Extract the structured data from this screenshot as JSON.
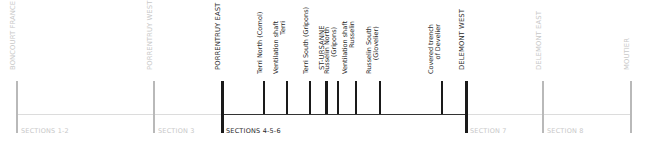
{
  "colors": {
    "active": "#1a1a1a",
    "inactive_tick": "#b9b9b9",
    "inactive_line": "#dcdcdc",
    "inactive_text": "#c8c8c8",
    "active_text": "#2a2a2a"
  },
  "stations": [
    {
      "name": "BONCOURT FRANCE",
      "lines": [
        "BONCOURT FRANCE"
      ],
      "kind": "major",
      "active": false
    },
    {
      "name": "PORRENTRUY WEST",
      "lines": [
        "PORRENTRUY WEST"
      ],
      "kind": "major",
      "active": false
    },
    {
      "name": "PORRENTRUY EAST",
      "lines": [
        "PORRENTRUY EAST"
      ],
      "kind": "major",
      "active": true
    },
    {
      "name": "Terri North (Cornol)",
      "lines": [
        "Terri North (Cornol)"
      ],
      "kind": "minor",
      "active": true
    },
    {
      "name": "Ventilation shaft Terri",
      "lines": [
        "Ventilation shaft",
        "Terri"
      ],
      "kind": "minor",
      "active": true
    },
    {
      "name": "Terri South (Gripons)",
      "lines": [
        "Terri South (Gripons)"
      ],
      "kind": "minor",
      "active": true
    },
    {
      "name": "ST-URSANNE",
      "lines": [
        "ST-URSANNE"
      ],
      "kind": "station",
      "active": true
    },
    {
      "name": "Russelin North (Gripons)",
      "lines": [
        "Russelin North",
        "(Gripons)"
      ],
      "kind": "minor",
      "active": true
    },
    {
      "name": "Ventilation shaft Russelin",
      "lines": [
        "Ventilation shaft",
        "Russelin"
      ],
      "kind": "minor",
      "active": true
    },
    {
      "name": "Russelin South (Glovelier)",
      "lines": [
        "Russelin South",
        "(Glovelier)"
      ],
      "kind": "minor",
      "active": true
    },
    {
      "name": "Covered trench of Develier",
      "lines": [
        "Covered trench",
        "of Develier"
      ],
      "kind": "minor",
      "active": true
    },
    {
      "name": "DELEMONT WEST",
      "lines": [
        "DELEMONT WEST"
      ],
      "kind": "major",
      "active": true
    },
    {
      "name": "DELEMONT EAST",
      "lines": [
        "DELEMONT EAST"
      ],
      "kind": "major",
      "active": false
    },
    {
      "name": "MOUTIER",
      "lines": [
        "MOUTIER"
      ],
      "kind": "major",
      "active": false
    }
  ],
  "sections": [
    {
      "label": "SECTIONS 1-2",
      "active": false
    },
    {
      "label": "SECTION 3",
      "active": false
    },
    {
      "label": "SECTIONS 4-5-6",
      "active": true
    },
    {
      "label": "SECTION 7",
      "active": false
    },
    {
      "label": "SECTION 8",
      "active": false
    }
  ]
}
